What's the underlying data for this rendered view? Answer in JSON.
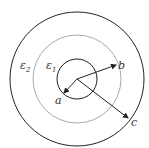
{
  "diagram": {
    "regions": [
      {
        "label": "ε",
        "subscript": "2",
        "name": "outer-dielectric"
      },
      {
        "label": "ε",
        "subscript": "1",
        "name": "inner-dielectric"
      }
    ],
    "radii": [
      {
        "label": "a",
        "name": "inner-radius"
      },
      {
        "label": "b",
        "name": "middle-radius"
      },
      {
        "label": "c",
        "name": "outer-radius"
      }
    ],
    "colors": {
      "solid_circle": "#222222",
      "dashed_circle": "#aaaaaa",
      "arrow": "#222222"
    }
  }
}
